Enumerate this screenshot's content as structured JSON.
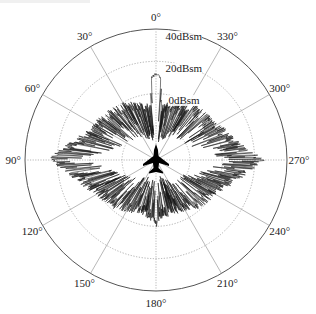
{
  "chart_data": {
    "type": "polar",
    "title": "",
    "angle_direction": "counterclockwise",
    "zero_location": "top",
    "angular_ticks": [
      {
        "deg": 0,
        "label": "0°"
      },
      {
        "deg": 30,
        "label": "30°"
      },
      {
        "deg": 60,
        "label": "60°"
      },
      {
        "deg": 90,
        "label": "90°"
      },
      {
        "deg": 120,
        "label": "120°"
      },
      {
        "deg": 150,
        "label": "150°"
      },
      {
        "deg": 180,
        "label": "180°"
      },
      {
        "deg": 210,
        "label": "210°"
      },
      {
        "deg": 240,
        "label": "240°"
      },
      {
        "deg": 270,
        "label": "270°"
      },
      {
        "deg": 300,
        "label": "300°"
      },
      {
        "deg": 330,
        "label": "330°"
      }
    ],
    "radial_ticks": [
      {
        "value": 0,
        "label": "0dBsm"
      },
      {
        "value": 20,
        "label": "20dBsm"
      },
      {
        "value": 40,
        "label": "40dBsm"
      }
    ],
    "radial_unit": "dBsm",
    "rlim": [
      -41,
      40
    ],
    "grid": true,
    "series": [
      {
        "name": "RCS",
        "color": "#111111",
        "envelope_dBsm": [
          {
            "deg": 0,
            "value": 12
          },
          {
            "deg": 3,
            "value": 10
          },
          {
            "deg": 6,
            "value": -6
          },
          {
            "deg": 15,
            "value": -4
          },
          {
            "deg": 30,
            "value": 0
          },
          {
            "deg": 45,
            "value": 2
          },
          {
            "deg": 60,
            "value": 4
          },
          {
            "deg": 75,
            "value": 10
          },
          {
            "deg": 85,
            "value": 20
          },
          {
            "deg": 90,
            "value": 28
          },
          {
            "deg": 95,
            "value": 18
          },
          {
            "deg": 105,
            "value": 10
          },
          {
            "deg": 120,
            "value": 2
          },
          {
            "deg": 135,
            "value": 0
          },
          {
            "deg": 150,
            "value": -4
          },
          {
            "deg": 165,
            "value": -6
          },
          {
            "deg": 180,
            "value": -2
          },
          {
            "deg": 195,
            "value": -6
          },
          {
            "deg": 210,
            "value": -4
          },
          {
            "deg": 225,
            "value": 0
          },
          {
            "deg": 240,
            "value": 2
          },
          {
            "deg": 255,
            "value": 10
          },
          {
            "deg": 265,
            "value": 20
          },
          {
            "deg": 270,
            "value": 28
          },
          {
            "deg": 275,
            "value": 18
          },
          {
            "deg": 285,
            "value": 10
          },
          {
            "deg": 300,
            "value": 4
          },
          {
            "deg": 315,
            "value": 2
          },
          {
            "deg": 330,
            "value": 0
          },
          {
            "deg": 345,
            "value": -4
          },
          {
            "deg": 354,
            "value": -6
          },
          {
            "deg": 357,
            "value": 10
          },
          {
            "deg": 360,
            "value": 12
          }
        ],
        "peaks": [
          {
            "deg": 0,
            "value": 13,
            "note": "nose-on double spike"
          },
          {
            "deg": 90,
            "value": 30,
            "note": "broadside lobe"
          },
          {
            "deg": 270,
            "value": 30,
            "note": "broadside lobe"
          }
        ]
      }
    ]
  },
  "colors": {
    "grid": "#9a9a9a",
    "outer_circle": "#555555",
    "data": "#111111",
    "text": "#222222",
    "background": "#ffffff"
  },
  "layout": {
    "cx": 156,
    "cy": 160,
    "r_outer": 131
  }
}
